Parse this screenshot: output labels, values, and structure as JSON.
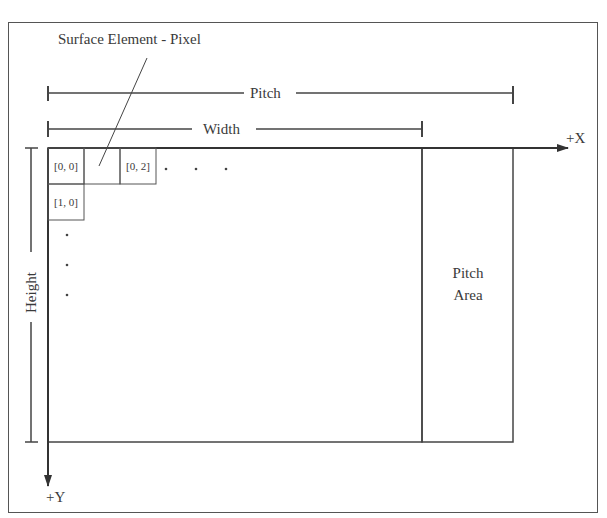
{
  "diagram": {
    "callout_label": "Surface Element - Pixel",
    "pitch_label": "Pitch",
    "width_label": "Width",
    "height_label": "Height",
    "x_axis_label": "+X",
    "y_axis_label": "+Y",
    "pitch_area_label_line1": "Pitch",
    "pitch_area_label_line2": "Area",
    "cells": [
      {
        "label": "[0, 0]"
      },
      {
        "label": ""
      },
      {
        "label": "[0, 2]"
      },
      {
        "label": "[1, 0]"
      }
    ],
    "ellipsis_dot": "."
  },
  "colors": {
    "line": "#3a3a3a",
    "text": "#3a3a3a",
    "background": "#ffffff"
  }
}
